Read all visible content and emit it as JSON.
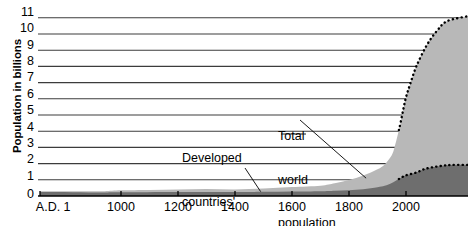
{
  "chart_data": {
    "type": "area",
    "title": "",
    "subtitle": "",
    "xlabel": "",
    "ylabel": "Population in billions",
    "xlim": [
      1,
      2150
    ],
    "ylim": [
      0,
      11.5
    ],
    "grid": true,
    "legend_position": "inline-annotations",
    "y_ticks": [
      11,
      10,
      9,
      8,
      7,
      6,
      5,
      4,
      3,
      2,
      1,
      0
    ],
    "x_ticks": [
      {
        "value": 1,
        "label": "A.D. 1"
      },
      {
        "value": 1000,
        "label": "1000"
      },
      {
        "value": 1200,
        "label": "1200"
      },
      {
        "value": 1400,
        "label": "1400"
      },
      {
        "value": 1600,
        "label": "1600"
      },
      {
        "value": 1800,
        "label": "1800"
      },
      {
        "value": 2000,
        "label": "2000"
      }
    ],
    "projection_start_year": 1975,
    "series": [
      {
        "name": "Total world population",
        "color": "#b8b8b8",
        "x": [
          1,
          200,
          400,
          600,
          800,
          1000,
          1100,
          1200,
          1300,
          1400,
          1500,
          1600,
          1700,
          1750,
          1800,
          1850,
          1900,
          1925,
          1950,
          1960,
          1970,
          1975,
          1980,
          1990,
          2000,
          2010,
          2025,
          2050,
          2075,
          2100,
          2150
        ],
        "values": [
          0.3,
          0.3,
          0.3,
          0.3,
          0.3,
          0.35,
          0.37,
          0.4,
          0.43,
          0.4,
          0.46,
          0.55,
          0.64,
          0.79,
          0.98,
          1.26,
          1.65,
          1.95,
          2.52,
          3.02,
          3.7,
          4.07,
          4.44,
          5.3,
          6.1,
          6.9,
          8.0,
          9.3,
          10.2,
          10.8,
          11.1
        ]
      },
      {
        "name": "Developed countries' populations",
        "color": "#6e6e6e",
        "x": [
          1,
          200,
          400,
          600,
          800,
          1000,
          1200,
          1400,
          1500,
          1600,
          1700,
          1750,
          1800,
          1850,
          1900,
          1925,
          1950,
          1960,
          1970,
          1975,
          1980,
          1990,
          2000,
          2025,
          2050,
          2100,
          2150
        ],
        "values": [
          0.25,
          0.24,
          0.23,
          0.22,
          0.22,
          0.23,
          0.25,
          0.24,
          0.26,
          0.28,
          0.3,
          0.33,
          0.36,
          0.42,
          0.54,
          0.63,
          0.81,
          0.9,
          1.0,
          1.05,
          1.1,
          1.2,
          1.28,
          1.45,
          1.7,
          1.9,
          1.92
        ]
      }
    ],
    "annotations": [
      {
        "name": "Total world population",
        "lines": [
          "Total",
          "world",
          "population"
        ],
        "text": "Total world population",
        "leader_to_year": 1860,
        "leader_to_value": 1.1
      },
      {
        "name": "Developed countries' populations",
        "lines": [
          "Developed",
          "countries'",
          "populations"
        ],
        "text": "Developed countries' populations",
        "leader_to_year": 1490,
        "leader_to_value": 0.27
      }
    ]
  },
  "axes": {
    "y_title": "Population in billions",
    "y_labels": [
      "11",
      "10",
      "9",
      "8",
      "7",
      "6",
      "5",
      "4",
      "3",
      "2",
      "1",
      "0"
    ],
    "x_labels": [
      "A.D. 1",
      "1000",
      "1200",
      "1400",
      "1600",
      "1800",
      "2000"
    ]
  },
  "annotations": {
    "developed": {
      "line1": "Developed",
      "line2": "countries'",
      "line3": "populations"
    },
    "total": {
      "line1": "Total",
      "line2": "world",
      "line3": "population"
    }
  },
  "colors": {
    "total_fill": "#b8b8b8",
    "developed_fill": "#6e6e6e",
    "gridline": "#3c3c3c",
    "axis": "#000000",
    "background": "#ffffff",
    "text": "#000000"
  }
}
